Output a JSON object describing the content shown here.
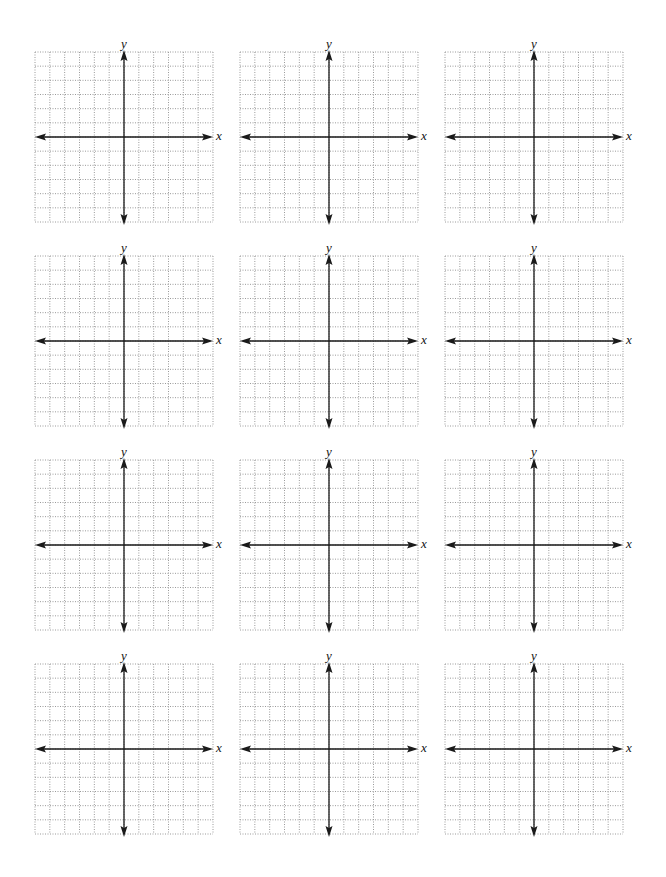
{
  "page": {
    "columns": 3,
    "rows": 4,
    "background": "#ffffff"
  },
  "panel_template": {
    "x_label": "x",
    "y_label": "y",
    "grid_cells_x": 12,
    "grid_cells_y": 12,
    "origin": "center",
    "grid_line_style": "dotted",
    "grid_color": "#9a9a9a",
    "axis_color": "#1a1a1a"
  },
  "panels": [
    {
      "id": 1,
      "x_label": "x",
      "y_label": "y"
    },
    {
      "id": 2,
      "x_label": "x",
      "y_label": "y"
    },
    {
      "id": 3,
      "x_label": "x",
      "y_label": "y"
    },
    {
      "id": 4,
      "x_label": "x",
      "y_label": "y"
    },
    {
      "id": 5,
      "x_label": "x",
      "y_label": "y"
    },
    {
      "id": 6,
      "x_label": "x",
      "y_label": "y"
    },
    {
      "id": 7,
      "x_label": "x",
      "y_label": "y"
    },
    {
      "id": 8,
      "x_label": "x",
      "y_label": "y"
    },
    {
      "id": 9,
      "x_label": "x",
      "y_label": "y"
    },
    {
      "id": 10,
      "x_label": "x",
      "y_label": "y"
    },
    {
      "id": 11,
      "x_label": "x",
      "y_label": "y"
    },
    {
      "id": 12,
      "x_label": "x",
      "y_label": "y"
    }
  ]
}
